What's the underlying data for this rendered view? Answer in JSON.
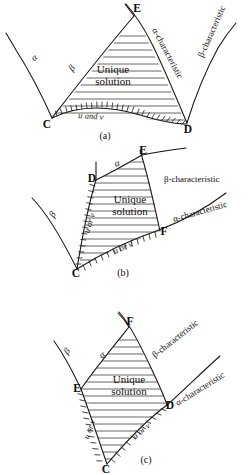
{
  "document": {
    "title": "Domains of unique solution for characteristic initial value problems",
    "figure_count": 3
  },
  "figures": [
    {
      "id": "fig-a",
      "caption": "(a)",
      "caption_pos": {
        "x": 105,
        "y": 138
      },
      "points": [
        {
          "name": "C",
          "label": "C",
          "x": 52,
          "y": 118
        },
        {
          "name": "D",
          "label": "D",
          "x": 187,
          "y": 124
        },
        {
          "name": "E",
          "label": "E",
          "x": 136,
          "y": 12
        }
      ],
      "curve_labels": [
        {
          "name": "alpha",
          "label": "α",
          "x": 36,
          "y": 60,
          "rotate": -38
        },
        {
          "name": "beta",
          "label": "β",
          "x": 76,
          "y": 68,
          "rotate": -52
        },
        {
          "name": "alpha-characteristic",
          "label": "α-characteristic",
          "x": 146,
          "y": 32,
          "rotate": 62
        },
        {
          "name": "beta-characteristic",
          "label": "β-characteristic",
          "x": 203,
          "y": 58,
          "rotate": -66
        }
      ],
      "region_label": {
        "line1": "Unique",
        "line2": "solution",
        "x": 113,
        "y": 73
      },
      "boundary_label": {
        "text": "u and v",
        "x": 78,
        "y": 116,
        "rotate": 5
      }
    },
    {
      "id": "fig-b",
      "caption": "(b)",
      "caption_pos": {
        "x": 123,
        "y": 275
      },
      "points": [
        {
          "name": "C",
          "label": "C",
          "x": 77,
          "y": 270
        },
        {
          "name": "D",
          "label": "D",
          "x": 96,
          "y": 180
        },
        {
          "name": "E",
          "label": "E",
          "x": 142,
          "y": 156
        },
        {
          "name": "F",
          "label": "F",
          "x": 160,
          "y": 231
        }
      ],
      "curve_labels": [
        {
          "name": "beta",
          "label": "β",
          "x": 55,
          "y": 216,
          "rotate": -62
        },
        {
          "name": "alpha",
          "label": "α",
          "x": 118,
          "y": 166,
          "rotate": -14
        },
        {
          "name": "beta-characteristic",
          "label": "β-characteristic",
          "x": 168,
          "y": 180,
          "rotate": 0
        },
        {
          "name": "alpha-characteristic",
          "label": "α-characteristic",
          "x": 178,
          "y": 219,
          "rotate": -16
        }
      ],
      "region_label": {
        "line1": "Unique",
        "line2": "solution",
        "x": 130,
        "y": 204
      },
      "boundary_labels": [
        {
          "name": "boundary-left",
          "text": "u or v",
          "x": 92,
          "y": 222,
          "rotate": -72
        },
        {
          "name": "boundary-bottom",
          "text": "u or v",
          "x": 122,
          "y": 248,
          "rotate": -24
        }
      ]
    },
    {
      "id": "fig-c",
      "caption": "(c)",
      "caption_pos": {
        "x": 146,
        "y": 460
      },
      "points": [
        {
          "name": "C",
          "label": "C",
          "x": 107,
          "y": 465
        },
        {
          "name": "E",
          "label": "E",
          "x": 81,
          "y": 390
        },
        {
          "name": "D",
          "label": "D",
          "x": 167,
          "y": 405
        },
        {
          "name": "F",
          "label": "F",
          "x": 129,
          "y": 327
        }
      ],
      "curve_labels": [
        {
          "name": "beta",
          "label": "β",
          "x": 69,
          "y": 353,
          "rotate": -52
        },
        {
          "name": "alpha",
          "label": "α",
          "x": 104,
          "y": 357,
          "rotate": -42
        },
        {
          "name": "beta-characteristic",
          "label": "β-characteristic",
          "x": 164,
          "y": 348,
          "rotate": -38
        },
        {
          "name": "alpha-characteristic",
          "label": "α-characteristic",
          "x": 186,
          "y": 398,
          "rotate": -30
        }
      ],
      "region_label": {
        "line1": "Unique",
        "line2": "solution",
        "x": 129,
        "y": 384
      },
      "boundary_labels": [
        {
          "name": "boundary-left",
          "text": "u or v",
          "x": 92,
          "y": 429,
          "rotate": -70
        },
        {
          "name": "boundary-right",
          "text": "u or v",
          "x": 143,
          "y": 431,
          "rotate": -22
        }
      ]
    }
  ],
  "colors": {
    "ink": "#16130f",
    "paper": "#ffffff",
    "hatch": "#3a342d"
  }
}
